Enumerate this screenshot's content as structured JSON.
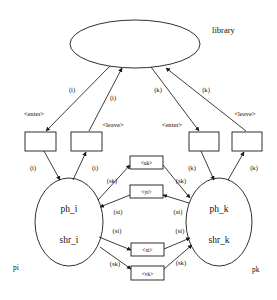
{
  "diagram": {
    "title_node": "library",
    "nodes": {
      "library": "library",
      "left_place_top": "ph_i",
      "left_place_bottom": "shr_i",
      "left_process": "pi",
      "right_place_top": "ph_k",
      "right_place_bottom": "shr_k",
      "right_process": "pk"
    },
    "transitions": [
      {
        "id": "enter-i",
        "label": "<enter>",
        "port": "(i)"
      },
      {
        "id": "leave-i",
        "label": "<leave>",
        "port": "(i)"
      },
      {
        "id": "enter-k",
        "label": "<enter>",
        "port": "(k)"
      },
      {
        "id": "leave-k",
        "label": "<leave>",
        "port": "(k)"
      }
    ],
    "channels": [
      {
        "id": "uk",
        "label": "<uk>"
      },
      {
        "id": "yi",
        "label": "<yi>"
      },
      {
        "id": "xi",
        "label": "<xi>"
      },
      {
        "id": "vk",
        "label": "<vk>"
      }
    ],
    "library_edge_labels": [
      "(i)",
      "(i)",
      "(k)",
      "(k)"
    ],
    "place_edge_labels": [
      "(i)",
      "(i)",
      "(k)",
      "(k)"
    ],
    "channel_edge_labels": {
      "uk_left": "(sk)",
      "uk_right": "(sk)",
      "yi_left": "(si)",
      "yi_right": "(si)",
      "xi_left": "(si)",
      "xi_right": "(si)",
      "vk_left": "(sk)",
      "vk_right": "(sk)"
    },
    "colors": {
      "stroke": "#1a1a1a",
      "fill": "#ffffff",
      "text": "#111111"
    }
  }
}
